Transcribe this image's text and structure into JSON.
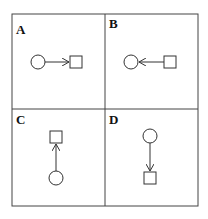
{
  "panels": [
    {
      "label": "A",
      "from": "circle",
      "to": "square",
      "direction": "right"
    },
    {
      "label": "B",
      "from": "square",
      "to": "circle",
      "direction": "left"
    },
    {
      "label": "C",
      "from": "circle",
      "to": "square",
      "direction": "up"
    },
    {
      "label": "D",
      "from": "circle",
      "to": "square",
      "direction": "down"
    }
  ],
  "colors": {
    "stroke": "#333333",
    "background": "#ffffff"
  }
}
